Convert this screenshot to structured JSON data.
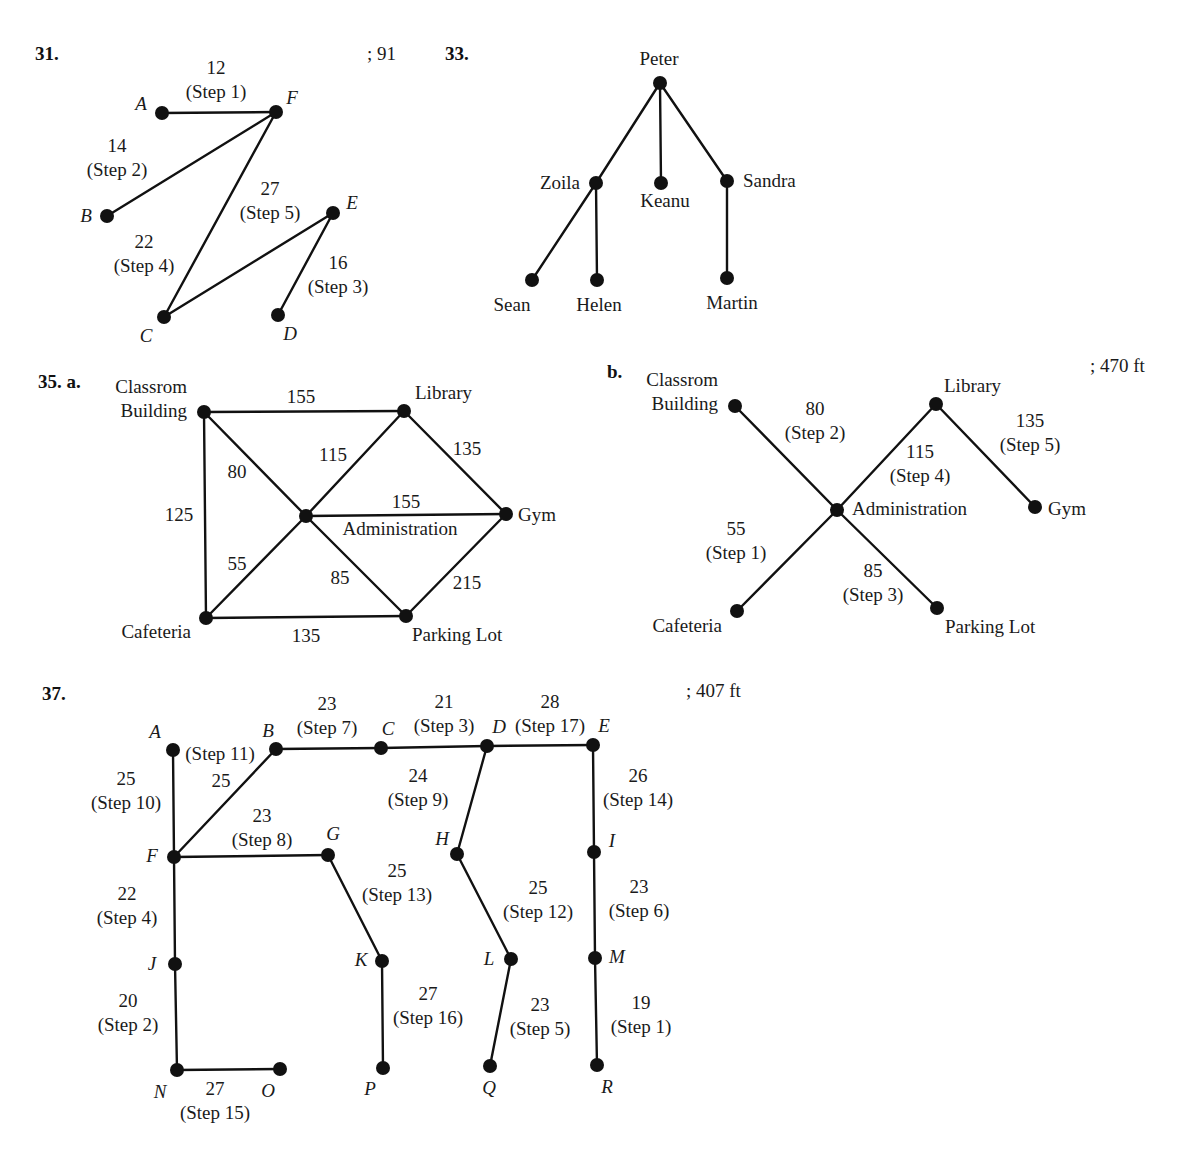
{
  "problems": [
    {
      "id": "p31",
      "number": "31.",
      "answer": "; 91",
      "number_pos": [
        35,
        60
      ],
      "answer_pos": [
        367,
        60
      ],
      "node_label_style": "italic",
      "nodes": [
        {
          "id": "A",
          "label": "A",
          "x": 162,
          "y": 113,
          "lx": 141,
          "ly": 110
        },
        {
          "id": "F",
          "label": "F",
          "x": 276,
          "y": 112,
          "lx": 292,
          "ly": 104
        },
        {
          "id": "B",
          "label": "B",
          "x": 107,
          "y": 216,
          "lx": 86,
          "ly": 222
        },
        {
          "id": "E",
          "label": "E",
          "x": 333,
          "y": 213,
          "lx": 352,
          "ly": 209
        },
        {
          "id": "C",
          "label": "C",
          "x": 164,
          "y": 317,
          "lx": 146,
          "ly": 342
        },
        {
          "id": "D",
          "label": "D",
          "x": 278,
          "y": 315,
          "lx": 290,
          "ly": 340
        }
      ],
      "edges": [
        {
          "from": "A",
          "to": "F",
          "weight": "12",
          "step": "(Step 1)",
          "lx": 216,
          "ly": 74
        },
        {
          "from": "F",
          "to": "B",
          "weight": "14",
          "step": "(Step 2)",
          "lx": 117,
          "ly": 152
        },
        {
          "from": "F",
          "to": "C",
          "weight": "22",
          "step": "(Step 4)",
          "lx": 144,
          "ly": 248
        },
        {
          "from": "C",
          "to": "E",
          "weight": "27",
          "step": "(Step 5)",
          "lx": 270,
          "ly": 195
        },
        {
          "from": "E",
          "to": "D",
          "weight": "16",
          "step": "(Step 3)",
          "lx": 338,
          "ly": 269
        }
      ]
    },
    {
      "id": "p33",
      "number": "33.",
      "answer": "",
      "number_pos": [
        445,
        60
      ],
      "answer_pos": [
        0,
        0
      ],
      "node_label_style": "normal",
      "nodes": [
        {
          "id": "Peter",
          "label": "Peter",
          "x": 660,
          "y": 83,
          "lx": 659,
          "ly": 65,
          "anchor": "middle"
        },
        {
          "id": "Zoila",
          "label": "Zoila",
          "x": 596,
          "y": 183,
          "lx": 580,
          "ly": 189,
          "anchor": "end"
        },
        {
          "id": "Keanu",
          "label": "Keanu",
          "x": 661,
          "y": 183,
          "lx": 665,
          "ly": 207,
          "anchor": "middle"
        },
        {
          "id": "Sandra",
          "label": "Sandra",
          "x": 727,
          "y": 181,
          "lx": 743,
          "ly": 187,
          "anchor": "start"
        },
        {
          "id": "Sean",
          "label": "Sean",
          "x": 532,
          "y": 280,
          "lx": 512,
          "ly": 311,
          "anchor": "middle"
        },
        {
          "id": "Helen",
          "label": "Helen",
          "x": 597,
          "y": 280,
          "lx": 599,
          "ly": 311,
          "anchor": "middle"
        },
        {
          "id": "Martin",
          "label": "Martin",
          "x": 727,
          "y": 278,
          "lx": 732,
          "ly": 309,
          "anchor": "middle"
        }
      ],
      "edges": [
        {
          "from": "Peter",
          "to": "Zoila"
        },
        {
          "from": "Peter",
          "to": "Keanu"
        },
        {
          "from": "Peter",
          "to": "Sandra"
        },
        {
          "from": "Zoila",
          "to": "Sean"
        },
        {
          "from": "Zoila",
          "to": "Helen"
        },
        {
          "from": "Sandra",
          "to": "Martin"
        }
      ]
    },
    {
      "id": "p35a",
      "number": "35. a.",
      "answer": "",
      "number_pos": [
        38,
        388
      ],
      "answer_pos": [
        0,
        0
      ],
      "node_label_style": "normal",
      "nodes": [
        {
          "id": "CB",
          "label": "Classrom|Building",
          "x": 204,
          "y": 412,
          "lx": 187,
          "ly": 393,
          "anchor": "end"
        },
        {
          "id": "LIB",
          "label": "Library",
          "x": 404,
          "y": 411,
          "lx": 415,
          "ly": 399,
          "anchor": "start"
        },
        {
          "id": "ADM",
          "label": "Administration",
          "x": 306,
          "y": 516,
          "lx": 400,
          "ly": 535,
          "anchor": "middle"
        },
        {
          "id": "GYM",
          "label": "Gym",
          "x": 506,
          "y": 514,
          "lx": 518,
          "ly": 521,
          "anchor": "start"
        },
        {
          "id": "CAF",
          "label": "Cafeteria",
          "x": 206,
          "y": 618,
          "lx": 191,
          "ly": 638,
          "anchor": "end"
        },
        {
          "id": "PL",
          "label": "Parking Lot",
          "x": 406,
          "y": 616,
          "lx": 412,
          "ly": 641,
          "anchor": "start"
        }
      ],
      "edges": [
        {
          "from": "CB",
          "to": "LIB",
          "weight": "155",
          "lx": 301,
          "ly": 403
        },
        {
          "from": "CB",
          "to": "CAF",
          "weight": "125",
          "lx": 179,
          "ly": 521
        },
        {
          "from": "CB",
          "to": "ADM",
          "weight": "80",
          "lx": 237,
          "ly": 478
        },
        {
          "from": "LIB",
          "to": "ADM",
          "weight": "115",
          "lx": 333,
          "ly": 461
        },
        {
          "from": "LIB",
          "to": "GYM",
          "weight": "135",
          "lx": 467,
          "ly": 455
        },
        {
          "from": "ADM",
          "to": "GYM",
          "weight": "155",
          "lx": 406,
          "ly": 508
        },
        {
          "from": "ADM",
          "to": "CAF",
          "weight": "55",
          "lx": 237,
          "ly": 570
        },
        {
          "from": "ADM",
          "to": "PL",
          "weight": "85",
          "lx": 340,
          "ly": 584
        },
        {
          "from": "GYM",
          "to": "PL",
          "weight": "215",
          "lx": 467,
          "ly": 589
        },
        {
          "from": "CAF",
          "to": "PL",
          "weight": "135",
          "lx": 306,
          "ly": 642
        }
      ]
    },
    {
      "id": "p35b",
      "number": "b.",
      "answer": "; 470 ft",
      "number_pos": [
        607,
        378
      ],
      "answer_pos": [
        1090,
        372
      ],
      "node_label_style": "normal",
      "nodes": [
        {
          "id": "CB",
          "label": "Classrom|Building",
          "x": 735,
          "y": 406,
          "lx": 718,
          "ly": 386,
          "anchor": "end"
        },
        {
          "id": "LIB",
          "label": "Library",
          "x": 936,
          "y": 404,
          "lx": 944,
          "ly": 392,
          "anchor": "start"
        },
        {
          "id": "ADM",
          "label": "Administration",
          "x": 837,
          "y": 510,
          "lx": 852,
          "ly": 515,
          "anchor": "start"
        },
        {
          "id": "GYM",
          "label": "Gym",
          "x": 1035,
          "y": 507,
          "lx": 1048,
          "ly": 515,
          "anchor": "start"
        },
        {
          "id": "CAF",
          "label": "Cafeteria",
          "x": 737,
          "y": 611,
          "lx": 722,
          "ly": 632,
          "anchor": "end"
        },
        {
          "id": "PL",
          "label": "Parking Lot",
          "x": 937,
          "y": 608,
          "lx": 945,
          "ly": 633,
          "anchor": "start"
        }
      ],
      "edges": [
        {
          "from": "CB",
          "to": "ADM",
          "weight": "80",
          "step": "(Step 2)",
          "lx": 815,
          "ly": 415
        },
        {
          "from": "LIB",
          "to": "ADM",
          "weight": "115",
          "step": "(Step 4)",
          "lx": 920,
          "ly": 458
        },
        {
          "from": "LIB",
          "to": "GYM",
          "weight": "135",
          "step": "(Step 5)",
          "lx": 1030,
          "ly": 427
        },
        {
          "from": "ADM",
          "to": "CAF",
          "weight": "55",
          "step": "(Step 1)",
          "lx": 736,
          "ly": 535
        },
        {
          "from": "ADM",
          "to": "PL",
          "weight": "85",
          "step": "(Step 3)",
          "lx": 873,
          "ly": 577
        }
      ]
    },
    {
      "id": "p37",
      "number": "37.",
      "answer": "; 407 ft",
      "number_pos": [
        42,
        700
      ],
      "answer_pos": [
        686,
        697
      ],
      "node_label_style": "italic",
      "nodes": [
        {
          "id": "A",
          "label": "A",
          "x": 173,
          "y": 750,
          "lx": 155,
          "ly": 738
        },
        {
          "id": "B",
          "label": "B",
          "x": 276,
          "y": 749,
          "lx": 268,
          "ly": 737
        },
        {
          "id": "C",
          "label": "C",
          "x": 381,
          "y": 748,
          "lx": 388,
          "ly": 735
        },
        {
          "id": "D",
          "label": "D",
          "x": 487,
          "y": 746,
          "lx": 499,
          "ly": 733
        },
        {
          "id": "E",
          "label": "E",
          "x": 593,
          "y": 745,
          "lx": 604,
          "ly": 732
        },
        {
          "id": "F",
          "label": "F",
          "x": 174,
          "y": 857,
          "lx": 152,
          "ly": 862
        },
        {
          "id": "G",
          "label": "G",
          "x": 328,
          "y": 855,
          "lx": 333,
          "ly": 840
        },
        {
          "id": "H",
          "label": "H",
          "x": 457,
          "y": 854,
          "lx": 442,
          "ly": 845
        },
        {
          "id": "I",
          "label": "I",
          "x": 594,
          "y": 852,
          "lx": 612,
          "ly": 847
        },
        {
          "id": "J",
          "label": "J",
          "x": 175,
          "y": 964,
          "lx": 152,
          "ly": 970
        },
        {
          "id": "K",
          "label": "K",
          "x": 382,
          "y": 961,
          "lx": 361,
          "ly": 966
        },
        {
          "id": "L",
          "label": "L",
          "x": 511,
          "y": 959,
          "lx": 489,
          "ly": 965
        },
        {
          "id": "M",
          "label": "M",
          "x": 595,
          "y": 958,
          "lx": 617,
          "ly": 963
        },
        {
          "id": "N",
          "label": "N",
          "x": 177,
          "y": 1070,
          "lx": 160,
          "ly": 1098
        },
        {
          "id": "O",
          "label": "O",
          "x": 280,
          "y": 1069,
          "lx": 268,
          "ly": 1097
        },
        {
          "id": "P",
          "label": "P",
          "x": 383,
          "y": 1068,
          "lx": 370,
          "ly": 1095
        },
        {
          "id": "Q",
          "label": "Q",
          "x": 490,
          "y": 1066,
          "lx": 489,
          "ly": 1094
        },
        {
          "id": "R",
          "label": "R",
          "x": 597,
          "y": 1065,
          "lx": 607,
          "ly": 1093
        }
      ],
      "edges": [
        {
          "from": "A",
          "to": "F",
          "weight": "25",
          "step": "(Step 10)",
          "lx": 126,
          "ly": 785
        },
        {
          "from": "B",
          "to": "F",
          "weight": "25",
          "step": "(Step 11)",
          "lx": 220,
          "ly": 755,
          "weight_pos": [
            221,
            787
          ],
          "step_pos": [
            220,
            760
          ]
        },
        {
          "from": "B",
          "to": "C",
          "weight": "23",
          "step": "(Step 7)",
          "lx": 327,
          "ly": 710
        },
        {
          "from": "C",
          "to": "D",
          "weight": "21",
          "step": "(Step 3)",
          "lx": 444,
          "ly": 708
        },
        {
          "from": "D",
          "to": "E",
          "weight": "28",
          "step": "(Step 17)",
          "lx": 550,
          "ly": 708
        },
        {
          "from": "D",
          "to": "H",
          "weight": "24",
          "step": "(Step 9)",
          "lx": 418,
          "ly": 782
        },
        {
          "from": "E",
          "to": "I",
          "weight": "26",
          "step": "(Step 14)",
          "lx": 638,
          "ly": 782
        },
        {
          "from": "F",
          "to": "G",
          "weight": "23",
          "step": "(Step 8)",
          "lx": 262,
          "ly": 822
        },
        {
          "from": "G",
          "to": "K",
          "weight": "25",
          "step": "(Step 13)",
          "lx": 397,
          "ly": 877
        },
        {
          "from": "H",
          "to": "L",
          "weight": "25",
          "step": "(Step 12)",
          "lx": 538,
          "ly": 894
        },
        {
          "from": "I",
          "to": "M",
          "weight": "23",
          "step": "(Step 6)",
          "lx": 639,
          "ly": 893
        },
        {
          "from": "F",
          "to": "J",
          "weight": "22",
          "step": "(Step 4)",
          "lx": 127,
          "ly": 900
        },
        {
          "from": "J",
          "to": "N",
          "weight": "20",
          "step": "(Step 2)",
          "lx": 128,
          "ly": 1007
        },
        {
          "from": "K",
          "to": "P",
          "weight": "27",
          "step": "(Step 16)",
          "lx": 428,
          "ly": 1000
        },
        {
          "from": "L",
          "to": "Q",
          "weight": "23",
          "step": "(Step 5)",
          "lx": 540,
          "ly": 1011
        },
        {
          "from": "M",
          "to": "R",
          "weight": "19",
          "step": "(Step 1)",
          "lx": 641,
          "ly": 1009
        },
        {
          "from": "N",
          "to": "O",
          "weight": "27",
          "step": "(Step 15)",
          "lx": 215,
          "ly": 1095
        }
      ]
    }
  ]
}
